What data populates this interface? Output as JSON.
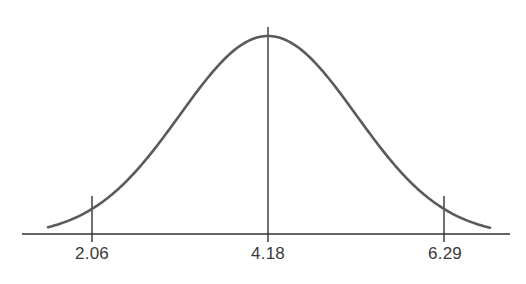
{
  "chart_data": {
    "type": "line",
    "title": "",
    "xlabel": "",
    "ylabel": "",
    "tick_labels": [
      "2.06",
      "4.18",
      "6.29"
    ],
    "x": [
      2.06,
      4.18,
      6.29
    ],
    "mean": 4.18,
    "markers": [
      {
        "value": 2.06,
        "label": "2.06",
        "kind": "tick"
      },
      {
        "value": 4.18,
        "label": "4.18",
        "kind": "center-line"
      },
      {
        "value": 6.29,
        "label": "6.29",
        "kind": "tick"
      }
    ],
    "grid": false,
    "legend": null,
    "colors": {
      "curve": "#5a5a5a",
      "axis": "#333333",
      "text": "#3a3a3a"
    }
  },
  "labels": {
    "left": "2.06",
    "center": "4.18",
    "right": "6.29"
  }
}
